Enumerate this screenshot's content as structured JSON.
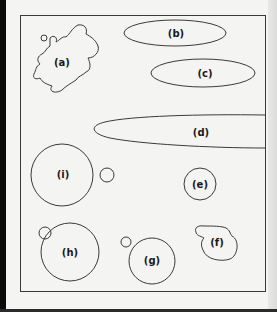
{
  "figure": {
    "stroke_color": "#3a3a3a",
    "background": "#f4f4f2",
    "shapes": [
      {
        "id": "a",
        "label": "(a)",
        "type": "irregular-blob"
      },
      {
        "id": "b",
        "label": "(b)",
        "type": "ellipse"
      },
      {
        "id": "c",
        "label": "(c)",
        "type": "ellipse"
      },
      {
        "id": "d",
        "label": "(d)",
        "type": "elongated-ellipse"
      },
      {
        "id": "e",
        "label": "(e)",
        "type": "small-circle"
      },
      {
        "id": "f",
        "label": "(f)",
        "type": "circle-with-protrusion"
      },
      {
        "id": "g",
        "label": "(g)",
        "type": "circle-with-satellite"
      },
      {
        "id": "h",
        "label": "(h)",
        "type": "circle-with-attached-satellite"
      },
      {
        "id": "i",
        "label": "(i)",
        "type": "large-circle-with-satellite"
      }
    ]
  }
}
